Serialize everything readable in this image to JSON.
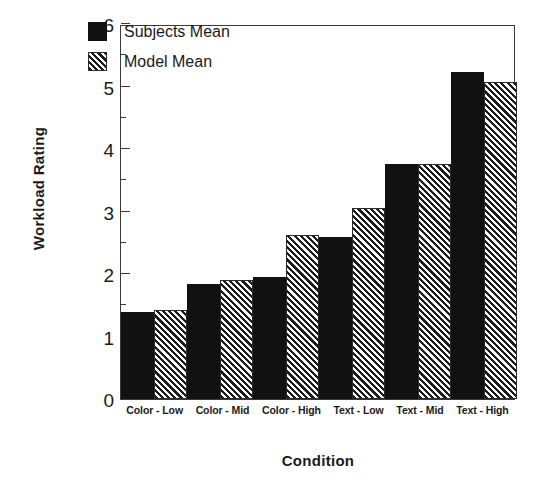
{
  "chart_data": {
    "type": "bar",
    "title": "",
    "xlabel": "Condition",
    "ylabel": "Workload Rating",
    "ylim": [
      0,
      6
    ],
    "yticks": [
      0,
      1,
      2,
      3,
      4,
      5,
      6
    ],
    "ytick_labels": [
      "0",
      "1",
      "2",
      "3",
      "4",
      "5",
      "6"
    ],
    "minor_yticks": [
      0.5,
      1.5,
      2.5,
      3.5,
      4.5,
      5.5
    ],
    "grid": false,
    "legend_position": "upper-left-inside",
    "categories": [
      "Color - Low",
      "Color - Mid",
      "Color - High",
      "Text - Low",
      "Text - Mid",
      "Text - High"
    ],
    "series": [
      {
        "name": "Subjects Mean",
        "fill": "solid-black",
        "color": "#111111",
        "values": [
          1.4,
          1.84,
          1.95,
          2.6,
          3.76,
          5.24
        ]
      },
      {
        "name": "Model Mean",
        "fill": "diagonal-hatch",
        "color": "#1c1c1c",
        "values": [
          1.43,
          1.9,
          2.63,
          3.05,
          3.76,
          5.07
        ]
      }
    ]
  },
  "axes": {
    "y_title": "Workload Rating",
    "x_title": "Condition"
  },
  "legend": {
    "entries": [
      {
        "label": "Subjects Mean",
        "swatch": "solid-swatch"
      },
      {
        "label": "Model Mean",
        "swatch": "hatched-swatch"
      }
    ]
  },
  "colors": {
    "subjects_mean": "#111111",
    "model_mean": "#1c1c1c",
    "axis": "#3a3a3a",
    "background": "#ffffff",
    "text": "#1a1a1a"
  }
}
